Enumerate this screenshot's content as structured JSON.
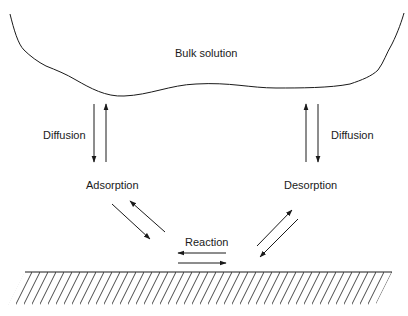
{
  "diagram": {
    "labels": {
      "bulk_solution": "Bulk solution",
      "diffusion_left": "Diffusion",
      "diffusion_right": "Diffusion",
      "adsorption": "Adsorption",
      "desorption": "Desorption",
      "reaction": "Reaction"
    },
    "regions": [
      {
        "name": "bulk-solution",
        "shape": "irregular curved boundary"
      },
      {
        "name": "solid-surface",
        "shape": "hatched ground"
      }
    ],
    "arrows": [
      {
        "from": "bulk-solution",
        "to": "adsorption",
        "label": "Diffusion"
      },
      {
        "from": "adsorption",
        "to": "bulk-solution",
        "label": "Diffusion"
      },
      {
        "from": "adsorption",
        "to": "solid-surface"
      },
      {
        "from": "solid-surface",
        "to": "adsorption"
      },
      {
        "from": "solid-surface",
        "to": "solid-surface",
        "label": "Reaction",
        "direction": "left"
      },
      {
        "from": "solid-surface",
        "to": "solid-surface",
        "label": "Reaction",
        "direction": "right"
      },
      {
        "from": "solid-surface",
        "to": "desorption"
      },
      {
        "from": "desorption",
        "to": "solid-surface"
      },
      {
        "from": "desorption",
        "to": "bulk-solution",
        "label": "Diffusion"
      },
      {
        "from": "bulk-solution",
        "to": "desorption",
        "label": "Diffusion"
      }
    ],
    "colors": {
      "stroke": "#1a1a1a",
      "background": "#ffffff"
    }
  }
}
